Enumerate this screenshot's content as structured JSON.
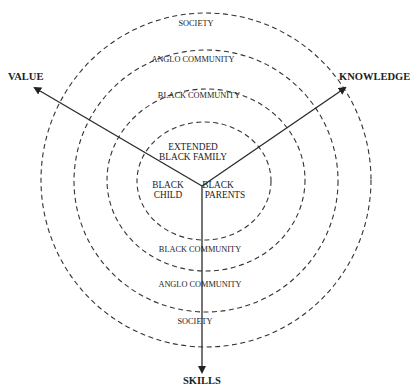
{
  "diagram": {
    "type": "concentric-ecological-model",
    "axes": {
      "value": {
        "label": "VALUE"
      },
      "knowledge": {
        "label": "KNOWLEDGE"
      },
      "skills": {
        "label": "SKILLS"
      }
    },
    "rings": {
      "outer": {
        "label_top": "SOCIETY",
        "label_bottom": "SOCIETY"
      },
      "third": {
        "label_top": "ANGLO COMMUNITY",
        "label_bottom": "ANGLO COMMUNITY"
      },
      "second": {
        "label_top": "BLACK COMMUNITY",
        "label_bottom": "BLACK COMMUNITY"
      },
      "inner": {
        "label_line1": "EXTENDED",
        "label_line2": "BLACK FAMILY"
      }
    },
    "core": {
      "left": {
        "line1": "BLACK",
        "line2": "CHILD"
      },
      "right": {
        "line1": "BLACK",
        "line2": "PARENTS"
      }
    },
    "colors": {
      "stroke": "#333333",
      "text": "#222222",
      "background": "#ffffff"
    }
  }
}
